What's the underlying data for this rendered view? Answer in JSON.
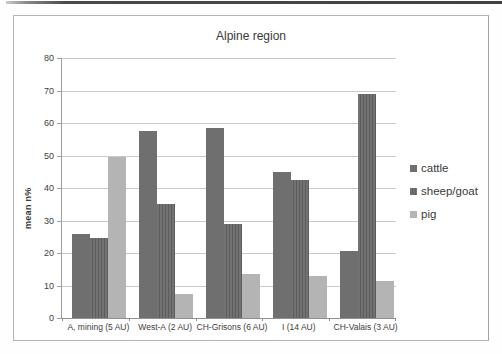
{
  "page": {
    "background": "#fefefe",
    "scan_edge_color": "#424242"
  },
  "chart_data": {
    "type": "bar",
    "title": "Alpine region",
    "xlabel": "",
    "ylabel": "mean n%",
    "ylim": [
      0,
      80
    ],
    "ytick_step": 10,
    "grid": true,
    "legend_position": "right",
    "categories": [
      "A, mining (5 AU)",
      "West-A (2 AU)",
      "CH-Grisons (6 AU)",
      "I (14 AU)",
      "CH-Valais (3 AU)"
    ],
    "series": [
      {
        "name": "cattle",
        "color": "#6f6f6f",
        "stripe_color": "",
        "values": [
          26,
          57.5,
          58.5,
          45,
          20.5
        ]
      },
      {
        "name": "sheep/goat",
        "color": "#727272",
        "stripe_color": "#5d5d5d",
        "values": [
          24.5,
          35,
          29,
          42.5,
          69
        ]
      },
      {
        "name": "pig",
        "color": "#b4b4b4",
        "stripe_color": "",
        "values": [
          49.5,
          7.5,
          13.5,
          13,
          11.5
        ]
      }
    ]
  }
}
